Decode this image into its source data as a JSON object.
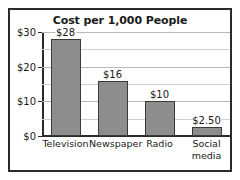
{
  "chart_data": {
    "type": "bar",
    "title": "Cost per 1,000 People",
    "xlabel": "",
    "ylabel": "",
    "categories": [
      "Television",
      "Newspaper",
      "Radio",
      "Social media"
    ],
    "category_lines": [
      [
        "Television"
      ],
      [
        "Newspaper"
      ],
      [
        "Radio"
      ],
      [
        "Social",
        "media"
      ]
    ],
    "values": [
      28,
      16,
      10,
      2.5
    ],
    "value_labels": [
      "$28",
      "$16",
      "$10",
      "$2.50"
    ],
    "ylim": [
      0,
      30
    ],
    "ytick_values": [
      0,
      10,
      20,
      30
    ],
    "ytick_labels": [
      "$0",
      "$10",
      "$20",
      "$30"
    ],
    "gridline_values": [
      5,
      10,
      15,
      20,
      25,
      30
    ],
    "grid": true,
    "legend": false,
    "bar_color": "#8d8d8d",
    "bar_edge_color": "#3a3a3a",
    "frame_color": "#2b2b2b",
    "gridline_color": "#b9b9b9",
    "text_color": "#1a1a1a"
  }
}
